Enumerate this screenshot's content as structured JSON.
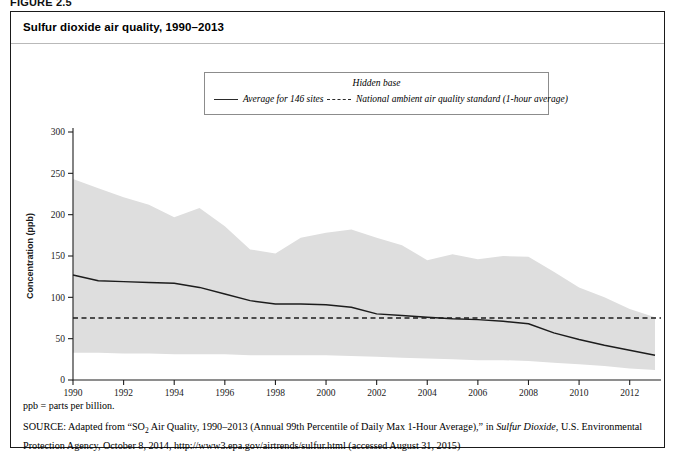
{
  "figure": {
    "label": "FIGURE 2.5",
    "title": "Sulfur dioxide air quality, 1990–2013"
  },
  "legend": {
    "title": "Hidden base",
    "entries": [
      {
        "label": "Average for 146 sites",
        "style": "solid",
        "icon": "solid-line-icon"
      },
      {
        "label": "National ambient air quality standard (1-hour average)",
        "style": "dashed",
        "icon": "dashed-line-icon"
      }
    ]
  },
  "footnotes": {
    "abbreviation": "ppb = parts per billion.",
    "source_prefix": "SOURCE:",
    "source_part1": " Adapted from “SO",
    "source_sub": "2",
    "source_part2": " Air Quality, 1990–2013 (Annual 99th Percentile of Daily Max 1-Hour Average),” in ",
    "source_italic": "Sulfur Dioxide",
    "source_part3": ", U.S. Environmental Protection Agency, October 8, 2014, http://www3.epa.gov/airtrends/sulfur.html (accessed August 31, 2015)"
  },
  "chart_data": {
    "type": "area",
    "title": "Sulfur dioxide air quality, 1990–2013",
    "xlabel": "",
    "ylabel": "Concentration (ppb)",
    "xlim": [
      1990,
      2013
    ],
    "ylim": [
      0,
      300
    ],
    "ytick_step": 50,
    "ytick_labels": [
      "0",
      "50",
      "100",
      "150",
      "200",
      "250",
      "300"
    ],
    "xtick_labels": [
      "1990",
      "1992",
      "1994",
      "1996",
      "1998",
      "2000",
      "2002",
      "2004",
      "2006",
      "2008",
      "2010",
      "2012"
    ],
    "grid": false,
    "legend_position": "top-center",
    "x": [
      1990,
      1991,
      1992,
      1993,
      1994,
      1995,
      1996,
      1997,
      1998,
      1999,
      2000,
      2001,
      2002,
      2003,
      2004,
      2005,
      2006,
      2007,
      2008,
      2009,
      2010,
      2011,
      2012,
      2013
    ],
    "series": [
      {
        "name": "Average for 146 sites",
        "style": "solid",
        "values": [
          127,
          120,
          119,
          118,
          117,
          112,
          104,
          96,
          92,
          92,
          91,
          88,
          80,
          78,
          76,
          74,
          73,
          71,
          68,
          57,
          49,
          42,
          36,
          30
        ]
      },
      {
        "name": "Hidden base upper bound (90th percentile)",
        "style": "band-upper",
        "values": [
          243,
          232,
          221,
          212,
          197,
          208,
          186,
          158,
          153,
          172,
          178,
          182,
          172,
          163,
          145,
          152,
          146,
          150,
          149,
          131,
          112,
          100,
          86,
          76
        ]
      },
      {
        "name": "Hidden base lower bound (10th percentile)",
        "style": "band-lower",
        "values": [
          33,
          33,
          32,
          32,
          31,
          31,
          31,
          30,
          30,
          30,
          30,
          29,
          28,
          27,
          26,
          25,
          24,
          24,
          23,
          21,
          19,
          17,
          14,
          12
        ]
      },
      {
        "name": "National ambient air quality standard (1-hour average)",
        "style": "dashed",
        "constant_value": 75
      }
    ],
    "colors": {
      "band": "#dedede",
      "line": "#1c1c1c",
      "standard": "#1c1c1c",
      "axis": "#1f1f1f"
    }
  }
}
